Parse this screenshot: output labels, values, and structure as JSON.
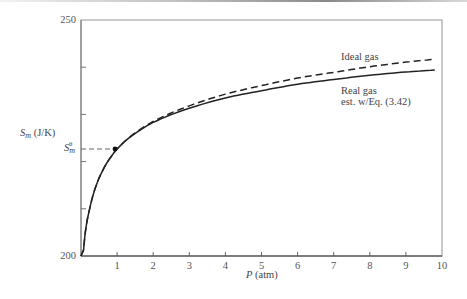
{
  "chart_data": {
    "type": "line",
    "title": "",
    "xlabel": "P (atm)",
    "ylabel": "S_m (J/K)",
    "xlim": [
      0,
      10
    ],
    "ylim": [
      200,
      250
    ],
    "x_ticks": [
      1,
      2,
      3,
      4,
      5,
      6,
      7,
      8,
      9,
      10
    ],
    "y_ticks_labeled": [
      200,
      250
    ],
    "y_minor_ticks": [
      210,
      220,
      230,
      240
    ],
    "reference_marker": {
      "label": "S_m^θ",
      "x": 1,
      "y": 222.7
    },
    "grid": false,
    "legend_position": "inline-labels-right",
    "series": [
      {
        "name": "Ideal gas",
        "style": "dashed",
        "x": [
          0.06,
          0.25,
          0.5,
          1,
          2,
          3,
          4,
          5,
          6,
          7,
          8,
          9,
          9.8
        ],
        "values": [
          200.0,
          210.3,
          216.5,
          222.7,
          228.5,
          231.8,
          234.3,
          236.1,
          237.7,
          238.9,
          240.1,
          241.1,
          241.7
        ]
      },
      {
        "name": "Real gas est. w/Eq. (3.42)",
        "style": "solid",
        "x": [
          0.06,
          0.25,
          0.5,
          1,
          2,
          3,
          4,
          5,
          6,
          7,
          8,
          9,
          9.8
        ],
        "values": [
          200.0,
          210.3,
          216.5,
          222.7,
          228.3,
          231.3,
          233.5,
          235.0,
          236.4,
          237.4,
          238.3,
          239.0,
          239.4
        ]
      }
    ]
  },
  "labels": {
    "y_top": "250",
    "y_bottom": "200",
    "y_axis_main": "S",
    "y_axis_sub": "m",
    "y_axis_units": "(J/K)",
    "ref_main": "S",
    "ref_sub": "m",
    "ref_sup": "θ",
    "x_axis_var": "P",
    "x_axis_units": "(atm)",
    "ideal_label": "Ideal gas",
    "real_label_1": "Real gas",
    "real_label_2": "est. w/Eq. (3.42)",
    "x_ticks": [
      "1",
      "2",
      "3",
      "4",
      "5",
      "6",
      "7",
      "8",
      "9",
      "10"
    ]
  }
}
